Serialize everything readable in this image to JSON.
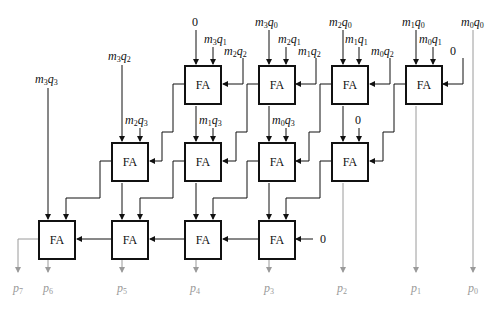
{
  "diagram": {
    "title": "",
    "cell_label": "FA",
    "zero_label": "0",
    "rows": [
      {
        "name": "row-1",
        "cells": [
          {
            "id": "fa-r1-c1",
            "in_a": "0",
            "in_b": "m3q1",
            "in_c": "m2q2"
          },
          {
            "id": "fa-r1-c2",
            "in_a": "m3q0",
            "in_b": "m2q1",
            "in_c": "m1q2"
          },
          {
            "id": "fa-r1-c3",
            "in_a": "m2q0",
            "in_b": "m1q1",
            "in_c": "m0q2"
          },
          {
            "id": "fa-r1-c4",
            "in_a": "m1q0",
            "in_b": "m0q1",
            "in_c": "0"
          }
        ]
      },
      {
        "name": "row-2",
        "cells": [
          {
            "id": "fa-r2-c1",
            "in_a": "m3q2",
            "in_b": "m2q3"
          },
          {
            "id": "fa-r2-c2",
            "in_b": "m1q3"
          },
          {
            "id": "fa-r2-c3",
            "in_b": "m0q3"
          },
          {
            "id": "fa-r2-c4",
            "in_b": "0"
          }
        ]
      },
      {
        "name": "row-3",
        "cells": [
          {
            "id": "fa-r3-c1",
            "in_a": "m3q3"
          },
          {
            "id": "fa-r3-c2"
          },
          {
            "id": "fa-r3-c3"
          },
          {
            "id": "fa-r3-c4",
            "in_c": "0"
          }
        ]
      }
    ],
    "direct_input": "m0q0",
    "outputs": [
      "p7",
      "p6",
      "p5",
      "p4",
      "p3",
      "p2",
      "p1",
      "p0"
    ],
    "colors": {
      "wire": "#111111",
      "output_wire": "#9a9a9a",
      "box_border": "#111111"
    }
  },
  "labels": {
    "m3q1": {
      "m": "m",
      "mi": "3",
      "q": "q",
      "qi": "1"
    },
    "m2q2": {
      "m": "m",
      "mi": "2",
      "q": "q",
      "qi": "2"
    },
    "m3q0": {
      "m": "m",
      "mi": "3",
      "q": "q",
      "qi": "0"
    },
    "m2q1": {
      "m": "m",
      "mi": "2",
      "q": "q",
      "qi": "1"
    },
    "m1q2": {
      "m": "m",
      "mi": "1",
      "q": "q",
      "qi": "2"
    },
    "m2q0": {
      "m": "m",
      "mi": "2",
      "q": "q",
      "qi": "0"
    },
    "m1q1": {
      "m": "m",
      "mi": "1",
      "q": "q",
      "qi": "1"
    },
    "m0q2": {
      "m": "m",
      "mi": "0",
      "q": "q",
      "qi": "2"
    },
    "m1q0": {
      "m": "m",
      "mi": "1",
      "q": "q",
      "qi": "0"
    },
    "m0q1": {
      "m": "m",
      "mi": "0",
      "q": "q",
      "qi": "1"
    },
    "m0q0": {
      "m": "m",
      "mi": "0",
      "q": "q",
      "qi": "0"
    },
    "m3q2": {
      "m": "m",
      "mi": "3",
      "q": "q",
      "qi": "2"
    },
    "m2q3": {
      "m": "m",
      "mi": "2",
      "q": "q",
      "qi": "3"
    },
    "m1q3": {
      "m": "m",
      "mi": "1",
      "q": "q",
      "qi": "3"
    },
    "m0q3": {
      "m": "m",
      "mi": "0",
      "q": "q",
      "qi": "3"
    },
    "m3q3": {
      "m": "m",
      "mi": "3",
      "q": "q",
      "qi": "3"
    }
  },
  "outputs": {
    "p7": {
      "p": "p",
      "i": "7"
    },
    "p6": {
      "p": "p",
      "i": "6"
    },
    "p5": {
      "p": "p",
      "i": "5"
    },
    "p4": {
      "p": "p",
      "i": "4"
    },
    "p3": {
      "p": "p",
      "i": "3"
    },
    "p2": {
      "p": "p",
      "i": "2"
    },
    "p1": {
      "p": "p",
      "i": "1"
    },
    "p0": {
      "p": "p",
      "i": "0"
    }
  }
}
